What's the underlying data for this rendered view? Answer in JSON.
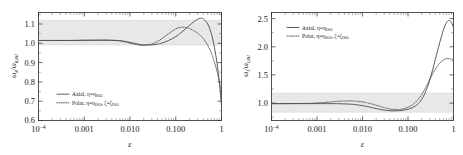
{
  "figure": {
    "type": "two-panel-line-plot",
    "background": "#ffffff",
    "curve_color": "#4a4a4a",
    "band_color": "#e8e8e8"
  },
  "panels": [
    {
      "id": "left",
      "ylabel": "ωR/ωR,BH",
      "ylabel_parts": {
        "num": "ω",
        "num_sub": "R",
        "den": "ω",
        "den_sub": "R,BH"
      },
      "xlabel": "ε",
      "x_ticks": [
        "10−4",
        "0.001",
        "0.010",
        "0.100",
        "1"
      ],
      "x_tick_values": [
        0.0001,
        0.001,
        0.01,
        0.1,
        1
      ],
      "y_ticks": [
        "0.6",
        "0.7",
        "0.8",
        "0.9",
        "1.0",
        "1.1"
      ],
      "y_tick_values": [
        0.6,
        0.7,
        0.8,
        0.9,
        1.0,
        1.1
      ],
      "ylim": [
        0.585,
        1.145
      ],
      "xlim": [
        0.0001,
        1
      ],
      "band": {
        "low": 0.918,
        "high": 1.082
      },
      "legend": [
        {
          "label": "Axial, η=η",
          "label_sub": "ISO",
          "style": "solid"
        },
        {
          "label": "Polar, η=η",
          "label_sub": "ISO",
          "label2": ", ζ=ζ",
          "label2_sub": "ISO",
          "style": "dotted"
        }
      ],
      "legend_position": "lower-left"
    },
    {
      "id": "right",
      "ylabel": "ωI/ωI,BH",
      "ylabel_parts": {
        "num": "ω",
        "num_sub": "I",
        "den": "ω",
        "den_sub": "I,BH"
      },
      "xlabel": "ε",
      "x_ticks": [
        "10−4",
        "0.001",
        "0.010",
        "0.100",
        "1"
      ],
      "x_tick_values": [
        0.0001,
        0.001,
        0.01,
        0.1,
        1
      ],
      "y_ticks": [
        "1.0",
        "1.5",
        "2.0",
        "2.5"
      ],
      "y_tick_values": [
        1.0,
        1.5,
        2.0,
        2.5
      ],
      "ylim": [
        0.7,
        2.62
      ],
      "xlim": [
        0.0001,
        1
      ],
      "band": {
        "low": 0.85,
        "high": 1.15
      },
      "legend": [
        {
          "label": "Axial, η=η",
          "label_sub": "ISO",
          "style": "solid"
        },
        {
          "label": "Polar, η=η",
          "label_sub": "ISO",
          "label2": ", ζ=ζ",
          "label2_sub": "ISO",
          "style": "dotted"
        }
      ],
      "legend_position": "upper-left"
    }
  ],
  "chart_data": [
    {
      "type": "line",
      "panel": "left",
      "title": "",
      "xlabel": "ε",
      "ylabel": "ωR/ωR,BH",
      "xscale": "log",
      "xlim": [
        0.0001,
        1
      ],
      "ylim": [
        0.585,
        1.145
      ],
      "grid": false,
      "legend_position": "lower left",
      "shaded_band": {
        "ylow": 0.918,
        "yhigh": 1.082,
        "label": "isospectrality band"
      },
      "series": [
        {
          "name": "Axial, η=ηISO",
          "style": "solid",
          "x": [
            0.0001,
            0.0002,
            0.0004,
            0.0007,
            0.001,
            0.002,
            0.003,
            0.005,
            0.007,
            0.01,
            0.015,
            0.02,
            0.03,
            0.04,
            0.05,
            0.07,
            0.1,
            0.13,
            0.16,
            0.2,
            0.25,
            0.3,
            0.35,
            0.4,
            0.5,
            0.6,
            0.7,
            0.8,
            0.9,
            1.0
          ],
          "y": [
            1.0,
            1.0,
            1.0,
            1.0,
            1.001,
            1.001,
            1.001,
            1.0,
            0.997,
            0.99,
            0.981,
            0.977,
            0.977,
            0.981,
            0.987,
            1.0,
            1.02,
            1.04,
            1.058,
            1.078,
            1.098,
            1.11,
            1.115,
            1.112,
            1.085,
            1.035,
            0.965,
            0.88,
            0.78,
            0.66
          ]
        },
        {
          "name": "Polar, η=ηISO, ζ=ζISO",
          "style": "dotted",
          "x": [
            0.0001,
            0.0002,
            0.0004,
            0.0007,
            0.001,
            0.002,
            0.003,
            0.005,
            0.007,
            0.01,
            0.015,
            0.02,
            0.03,
            0.04,
            0.05,
            0.07,
            0.1,
            0.13,
            0.16,
            0.2,
            0.25,
            0.3,
            0.35,
            0.4,
            0.5,
            0.6,
            0.7,
            0.8,
            0.9,
            1.0
          ],
          "y": [
            1.0,
            1.0,
            1.0,
            1.001,
            1.001,
            1.002,
            1.002,
            1.0,
            0.995,
            0.986,
            0.977,
            0.975,
            0.982,
            0.995,
            1.01,
            1.035,
            1.06,
            1.068,
            1.068,
            1.062,
            1.05,
            1.038,
            1.025,
            1.01,
            0.975,
            0.935,
            0.888,
            0.838,
            0.785,
            0.725
          ]
        }
      ]
    },
    {
      "type": "line",
      "panel": "right",
      "title": "",
      "xlabel": "ε",
      "ylabel": "ωI/ωI,BH",
      "xscale": "log",
      "xlim": [
        0.0001,
        1
      ],
      "ylim": [
        0.7,
        2.62
      ],
      "grid": false,
      "legend_position": "upper left",
      "shaded_band": {
        "ylow": 0.85,
        "yhigh": 1.15,
        "label": "isospectrality band"
      },
      "series": [
        {
          "name": "Axial, η=ηISO",
          "style": "solid",
          "x": [
            0.0001,
            0.0003,
            0.0006,
            0.001,
            0.002,
            0.003,
            0.005,
            0.007,
            0.01,
            0.015,
            0.02,
            0.03,
            0.04,
            0.05,
            0.07,
            0.1,
            0.13,
            0.16,
            0.2,
            0.25,
            0.3,
            0.35,
            0.4,
            0.5,
            0.6,
            0.7,
            0.8,
            0.9,
            1.0
          ],
          "y": [
            1.0,
            1.0,
            1.0,
            1.0,
            1.0,
            0.998,
            0.992,
            0.982,
            0.965,
            0.935,
            0.912,
            0.885,
            0.875,
            0.872,
            0.878,
            0.9,
            0.935,
            0.985,
            1.075,
            1.235,
            1.42,
            1.61,
            1.79,
            2.09,
            2.31,
            2.44,
            2.48,
            2.44,
            2.36
          ]
        },
        {
          "name": "Polar, η=ηISO, ζ=ζISO",
          "style": "dotted",
          "x": [
            0.0001,
            0.0003,
            0.0006,
            0.001,
            0.002,
            0.003,
            0.005,
            0.007,
            0.01,
            0.015,
            0.02,
            0.03,
            0.04,
            0.05,
            0.07,
            0.1,
            0.13,
            0.16,
            0.2,
            0.25,
            0.3,
            0.35,
            0.4,
            0.5,
            0.6,
            0.7,
            0.8,
            0.9,
            1.0
          ],
          "y": [
            1.0,
            1.001,
            1.004,
            1.012,
            1.03,
            1.042,
            1.048,
            1.044,
            1.03,
            1.0,
            0.972,
            0.93,
            0.905,
            0.895,
            0.9,
            0.935,
            0.99,
            1.06,
            1.16,
            1.3,
            1.425,
            1.53,
            1.615,
            1.72,
            1.775,
            1.8,
            1.8,
            1.79,
            1.775
          ]
        }
      ]
    }
  ]
}
